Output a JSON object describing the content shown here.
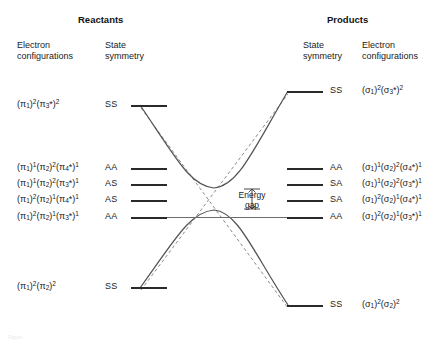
{
  "figure": {
    "type": "state-correlation-diagram",
    "caption_faint": "Figure",
    "headers": {
      "left": "Reactants",
      "right": "Products"
    },
    "column_labels": {
      "left_config": "Electron\nconfigurations",
      "left_config_line1": "Electron",
      "left_config_line2": "configurations",
      "left_symmetry_line1": "State",
      "left_symmetry_line2": "symmetry",
      "right_symmetry_line1": "State",
      "right_symmetry_line2": "symmetry",
      "right_config_line1": "Electron",
      "right_config_line2": "configurations"
    },
    "annotation": {
      "energy_gap_line1": "Energy",
      "energy_gap_line2": "gap"
    },
    "colors": {
      "level_bar": "#2a2a2a",
      "adiabatic_curve": "#555555",
      "diabatic_curve": "#8a8a8a",
      "correlation_line": "#6d6d6d",
      "text": "#222222"
    }
  },
  "reactant_states": [
    {
      "symmetry": "SS",
      "config": [
        [
          "π",
          "1",
          "2"
        ],
        [
          "π",
          "3*",
          "2"
        ]
      ],
      "y": 105
    },
    {
      "symmetry": "AA",
      "config": [
        [
          "π",
          "1",
          "1"
        ],
        [
          "π",
          "2",
          "2"
        ],
        [
          "π",
          "4*",
          "1"
        ]
      ],
      "y": 168
    },
    {
      "symmetry": "AS",
      "config": [
        [
          "π",
          "1",
          "1"
        ],
        [
          "π",
          "2",
          "2"
        ],
        [
          "π",
          "3*",
          "1"
        ]
      ],
      "y": 184
    },
    {
      "symmetry": "AS",
      "config": [
        [
          "π",
          "1",
          "2"
        ],
        [
          "π",
          "2",
          "1"
        ],
        [
          "π",
          "4*",
          "1"
        ]
      ],
      "y": 200
    },
    {
      "symmetry": "AA",
      "config": [
        [
          "π",
          "1",
          "2"
        ],
        [
          "π",
          "2",
          "1"
        ],
        [
          "π",
          "3*",
          "1"
        ]
      ],
      "y": 217
    },
    {
      "symmetry": "SS",
      "config": [
        [
          "π",
          "1",
          "2"
        ],
        [
          "π",
          "2",
          "2"
        ]
      ],
      "y": 287
    }
  ],
  "product_states": [
    {
      "symmetry": "SS",
      "config": [
        [
          "σ",
          "1",
          "2"
        ],
        [
          "σ",
          "3*",
          "2"
        ]
      ],
      "y": 91
    },
    {
      "symmetry": "AA",
      "config": [
        [
          "σ",
          "1",
          "1"
        ],
        [
          "σ",
          "2",
          "2"
        ],
        [
          "σ",
          "4*",
          "1"
        ]
      ],
      "y": 168
    },
    {
      "symmetry": "SA",
      "config": [
        [
          "σ",
          "1",
          "1"
        ],
        [
          "σ",
          "2",
          "2"
        ],
        [
          "σ",
          "3*",
          "1"
        ]
      ],
      "y": 184
    },
    {
      "symmetry": "SA",
      "config": [
        [
          "σ",
          "1",
          "2"
        ],
        [
          "σ",
          "2",
          "1"
        ],
        [
          "σ",
          "4*",
          "1"
        ]
      ],
      "y": 200
    },
    {
      "symmetry": "AA",
      "config": [
        [
          "σ",
          "1",
          "2"
        ],
        [
          "σ",
          "2",
          "1"
        ],
        [
          "σ",
          "3*",
          "1"
        ]
      ],
      "y": 217
    },
    {
      "symmetry": "SS",
      "config": [
        [
          "σ",
          "1",
          "2"
        ],
        [
          "σ",
          "2",
          "2"
        ]
      ],
      "y": 305
    }
  ]
}
